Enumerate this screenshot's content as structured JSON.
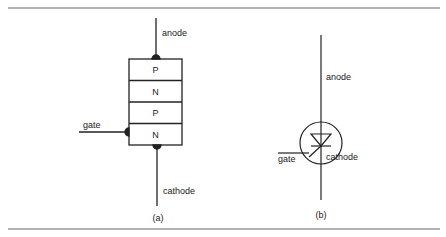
{
  "figure_a": {
    "anode_label": "anode",
    "cathode_label": "cathode",
    "gate_label": "gate",
    "layers": [
      "P",
      "N",
      "P",
      "N"
    ],
    "caption": "(a)"
  },
  "figure_b": {
    "anode_label": "anode",
    "cathode_label": "cathode",
    "gate_label": "gate",
    "caption": "(b)"
  },
  "colors": {
    "line": "#222222",
    "rule": "#555555"
  }
}
